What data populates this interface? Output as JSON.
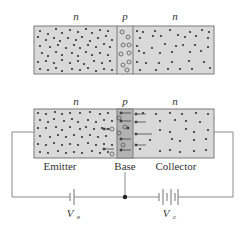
{
  "diagram": {
    "top": {
      "regions": [
        {
          "label": "n",
          "role": "emitter-region"
        },
        {
          "label": "p",
          "role": "base-region"
        },
        {
          "label": "n",
          "role": "collector-region"
        }
      ]
    },
    "bottom": {
      "regions": [
        {
          "label": "n",
          "name": "Emitter"
        },
        {
          "label": "p",
          "name": "Base"
        },
        {
          "label": "n",
          "name": "Collector"
        }
      ]
    },
    "batteries": {
      "emitter": {
        "symbol": "V",
        "subscript": "e"
      },
      "collector": {
        "symbol": "V",
        "subscript": "c"
      }
    },
    "colors": {
      "region_fill": "#d9d9d9",
      "base_fill_biased": "#b3b3b3",
      "outline": "#7a7a7a",
      "dot": "#333333",
      "wire": "#8a8a8a"
    }
  }
}
